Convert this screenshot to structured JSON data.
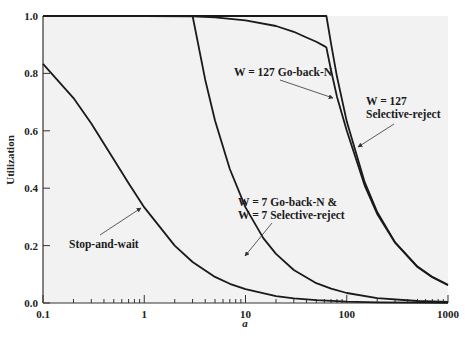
{
  "chart_data": {
    "type": "line",
    "title": "",
    "xlabel": "a",
    "ylabel": "Utilization",
    "xscale": "log",
    "xlim": [
      0.1,
      1000
    ],
    "ylim": [
      0.0,
      1.0
    ],
    "x_ticks": [
      "0.1",
      "1",
      "10",
      "100",
      "1000"
    ],
    "y_ticks": [
      "0.0",
      "0.2",
      "0.4",
      "0.6",
      "0.8",
      "1.0"
    ],
    "grid": false,
    "legend": "none (inline annotations)",
    "background": "#f2f2f2",
    "line_color": "#1a1a1a",
    "series": [
      {
        "name": "Stop-and-wait",
        "x": [
          0.1,
          0.2,
          0.3,
          0.5,
          0.7,
          1,
          2,
          3,
          5,
          7,
          10,
          20,
          30,
          50,
          100,
          200,
          500,
          1000
        ],
        "values": [
          0.833,
          0.714,
          0.625,
          0.5,
          0.417,
          0.333,
          0.2,
          0.143,
          0.091,
          0.067,
          0.048,
          0.024,
          0.016,
          0.01,
          0.005,
          0.0025,
          0.001,
          0.0005
        ]
      },
      {
        "name": "W = 7 Go-back-N & W = 7 Selective-reject",
        "x": [
          0.1,
          1,
          2,
          3,
          4,
          5,
          7,
          10,
          15,
          20,
          30,
          50,
          70,
          100,
          200,
          500,
          1000
        ],
        "values": [
          1.0,
          1.0,
          1.0,
          1.0,
          0.778,
          0.636,
          0.467,
          0.333,
          0.226,
          0.171,
          0.115,
          0.069,
          0.05,
          0.035,
          0.017,
          0.007,
          0.0035
        ]
      },
      {
        "name": "W = 127 Go-back-N",
        "x": [
          0.1,
          1,
          3,
          5,
          10,
          20,
          30,
          40,
          50,
          60,
          63,
          70,
          80,
          100,
          150,
          200,
          300,
          500,
          700,
          1000
        ],
        "values": [
          1.0,
          1.0,
          0.999,
          0.995,
          0.985,
          0.965,
          0.945,
          0.925,
          0.91,
          0.895,
          0.89,
          0.81,
          0.72,
          0.6,
          0.41,
          0.31,
          0.21,
          0.125,
          0.09,
          0.062
        ]
      },
      {
        "name": "W = 127 Selective-reject",
        "x": [
          0.1,
          1,
          10,
          30,
          50,
          63,
          70,
          80,
          100,
          150,
          200,
          300,
          500,
          700,
          1000
        ],
        "values": [
          1.0,
          1.0,
          1.0,
          1.0,
          1.0,
          1.0,
          0.903,
          0.79,
          0.632,
          0.422,
          0.317,
          0.211,
          0.127,
          0.091,
          0.0635
        ]
      }
    ],
    "annotations": [
      {
        "text": "Stop-and-wait",
        "points_to": [
          1,
          0.333
        ]
      },
      {
        "text": "W = 7 Go-back-N &",
        "line": 1,
        "points_to": [
          10,
          0.38
        ]
      },
      {
        "text": "W = 7 Selective-reject",
        "line": 2
      },
      {
        "text": "W = 127 Go-back-N",
        "points_to": [
          70,
          0.81
        ]
      },
      {
        "text": "W = 127",
        "line": 1,
        "points_to": [
          80,
          0.79
        ]
      },
      {
        "text": "Selective-reject",
        "line": 2
      }
    ]
  },
  "labels": {
    "ylabel": "Utilization",
    "xlabel": "a",
    "ann_saw": "Stop-and-wait",
    "ann_w7_a": "W = 7 Go-back-N &",
    "ann_w7_b": "W = 7 Selective-reject",
    "ann_w127gbn": "W = 127 Go-back-N",
    "ann_w127sr_a": "W = 127",
    "ann_w127sr_b": "Selective-reject"
  }
}
